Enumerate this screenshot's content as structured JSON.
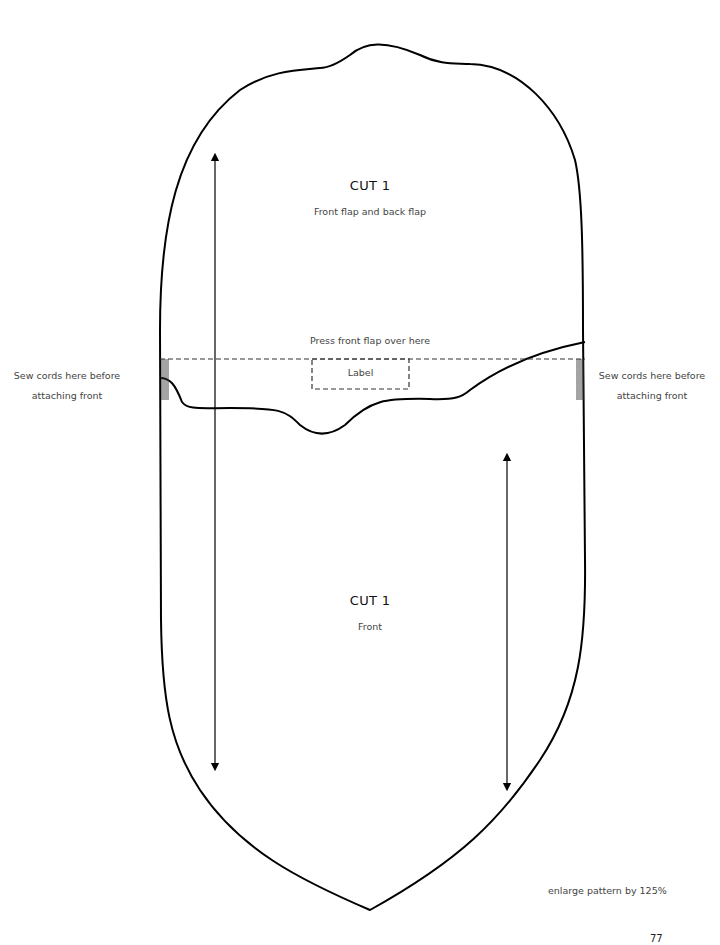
{
  "pattern": {
    "upper_piece": {
      "title": "CUT 1",
      "subtitle": "Front flap and back flap"
    },
    "lower_piece": {
      "title": "CUT 1",
      "subtitle": "Front"
    },
    "fold_line_label": "Press front flap over here",
    "label_box": "Label",
    "left_note": "Sew cords here before attaching front",
    "right_note": "Sew cords here before attaching front",
    "footer_note": "enlarge pattern by 125%",
    "page_number": "77",
    "line_color": "#000000",
    "icons": [
      "grainline-arrow-upper",
      "grainline-arrow-lower",
      "cord-marks-left",
      "cord-marks-right"
    ]
  }
}
